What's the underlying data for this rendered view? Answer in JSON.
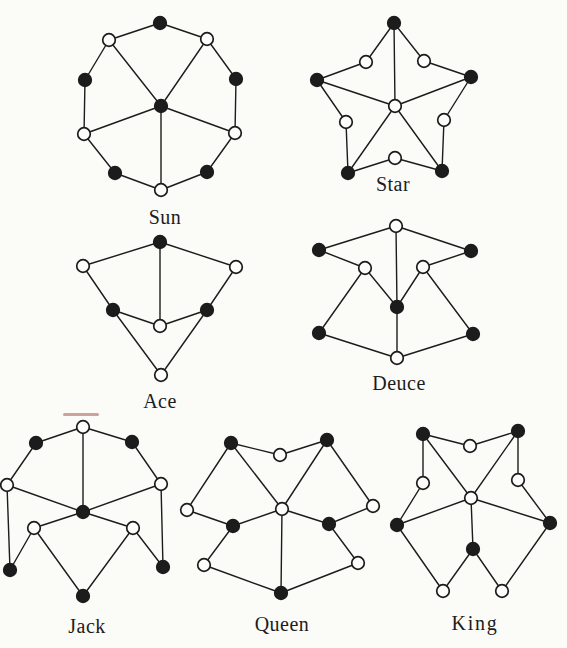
{
  "page": {
    "background": "#fbfbf8",
    "ink": "#1c1c1c",
    "open_fill": "#fdfdfc",
    "artifact": {
      "x": 63,
      "y": 413,
      "w": 36,
      "h": 3,
      "color": "rgba(145,55,45,0.45)"
    }
  },
  "style": {
    "vertex_radius": 6.3,
    "vertex_stroke_width": 1.7,
    "edge_width": 1.4,
    "label_font_size": 20,
    "default_letter_spacing": 0.5
  },
  "graphs": [
    {
      "id": "sun",
      "label": "Sun",
      "label_x": 165,
      "label_y": 224,
      "label_spacing": 0.5,
      "vertices": [
        {
          "id": "t",
          "x": 160,
          "y": 23,
          "fill": "black"
        },
        {
          "id": "tlw",
          "x": 109,
          "y": 40,
          "fill": "white"
        },
        {
          "id": "trw",
          "x": 207,
          "y": 39,
          "fill": "white"
        },
        {
          "id": "l",
          "x": 85,
          "y": 80,
          "fill": "black"
        },
        {
          "id": "r",
          "x": 236,
          "y": 79,
          "fill": "black"
        },
        {
          "id": "c",
          "x": 161,
          "y": 106,
          "fill": "black"
        },
        {
          "id": "llw",
          "x": 84,
          "y": 134,
          "fill": "white"
        },
        {
          "id": "lrw",
          "x": 235,
          "y": 133,
          "fill": "white"
        },
        {
          "id": "blb",
          "x": 115,
          "y": 173,
          "fill": "black"
        },
        {
          "id": "brb",
          "x": 207,
          "y": 172,
          "fill": "black"
        },
        {
          "id": "bw",
          "x": 161,
          "y": 190,
          "fill": "white"
        }
      ],
      "edges": [
        [
          "t",
          "trw"
        ],
        [
          "trw",
          "r"
        ],
        [
          "r",
          "lrw"
        ],
        [
          "lrw",
          "brb"
        ],
        [
          "brb",
          "bw"
        ],
        [
          "bw",
          "blb"
        ],
        [
          "blb",
          "llw"
        ],
        [
          "llw",
          "l"
        ],
        [
          "l",
          "tlw"
        ],
        [
          "tlw",
          "t"
        ],
        [
          "c",
          "tlw"
        ],
        [
          "c",
          "trw"
        ],
        [
          "c",
          "llw"
        ],
        [
          "c",
          "lrw"
        ],
        [
          "c",
          "bw"
        ]
      ]
    },
    {
      "id": "star",
      "label": "Star",
      "label_x": 393,
      "label_y": 191,
      "label_spacing": 0.5,
      "vertices": [
        {
          "id": "t",
          "x": 394,
          "y": 23,
          "fill": "black"
        },
        {
          "id": "ulw",
          "x": 366,
          "y": 62,
          "fill": "white"
        },
        {
          "id": "urw",
          "x": 424,
          "y": 61,
          "fill": "white"
        },
        {
          "id": "l",
          "x": 317,
          "y": 80,
          "fill": "black"
        },
        {
          "id": "r",
          "x": 471,
          "y": 77,
          "fill": "black"
        },
        {
          "id": "c",
          "x": 395,
          "y": 106,
          "fill": "white"
        },
        {
          "id": "llw",
          "x": 346,
          "y": 122,
          "fill": "white"
        },
        {
          "id": "lrw",
          "x": 444,
          "y": 120,
          "fill": "white"
        },
        {
          "id": "bw",
          "x": 395,
          "y": 158,
          "fill": "white"
        },
        {
          "id": "bl",
          "x": 348,
          "y": 173,
          "fill": "black"
        },
        {
          "id": "br",
          "x": 442,
          "y": 171,
          "fill": "black"
        }
      ],
      "edges": [
        [
          "t",
          "ulw"
        ],
        [
          "ulw",
          "l"
        ],
        [
          "l",
          "llw"
        ],
        [
          "llw",
          "bl"
        ],
        [
          "bl",
          "bw"
        ],
        [
          "bw",
          "br"
        ],
        [
          "br",
          "lrw"
        ],
        [
          "lrw",
          "r"
        ],
        [
          "r",
          "urw"
        ],
        [
          "urw",
          "t"
        ],
        [
          "c",
          "t"
        ],
        [
          "c",
          "l"
        ],
        [
          "c",
          "r"
        ],
        [
          "c",
          "bl"
        ],
        [
          "c",
          "br"
        ]
      ]
    },
    {
      "id": "ace",
      "label": "Ace",
      "label_x": 160,
      "label_y": 408,
      "label_spacing": 0.5,
      "vertices": [
        {
          "id": "t",
          "x": 160,
          "y": 242,
          "fill": "black"
        },
        {
          "id": "lw",
          "x": 83,
          "y": 266,
          "fill": "white"
        },
        {
          "id": "rw",
          "x": 236,
          "y": 267,
          "fill": "white"
        },
        {
          "id": "mlb",
          "x": 113,
          "y": 310,
          "fill": "black"
        },
        {
          "id": "mrb",
          "x": 207,
          "y": 310,
          "fill": "black"
        },
        {
          "id": "c",
          "x": 160,
          "y": 326,
          "fill": "white"
        },
        {
          "id": "bw",
          "x": 161,
          "y": 375,
          "fill": "white"
        }
      ],
      "edges": [
        [
          "t",
          "lw"
        ],
        [
          "t",
          "rw"
        ],
        [
          "t",
          "c"
        ],
        [
          "lw",
          "mlb"
        ],
        [
          "rw",
          "mrb"
        ],
        [
          "mlb",
          "c"
        ],
        [
          "mrb",
          "c"
        ],
        [
          "mlb",
          "bw"
        ],
        [
          "mrb",
          "bw"
        ]
      ]
    },
    {
      "id": "deuce",
      "label": "Deuce",
      "label_x": 399,
      "label_y": 390,
      "label_spacing": 0.5,
      "vertices": [
        {
          "id": "tw",
          "x": 396,
          "y": 226,
          "fill": "white"
        },
        {
          "id": "ulb",
          "x": 319,
          "y": 250,
          "fill": "black"
        },
        {
          "id": "urb",
          "x": 471,
          "y": 251,
          "fill": "black"
        },
        {
          "id": "mlw",
          "x": 365,
          "y": 268,
          "fill": "white"
        },
        {
          "id": "mrw",
          "x": 423,
          "y": 267,
          "fill": "white"
        },
        {
          "id": "c",
          "x": 397,
          "y": 307,
          "fill": "black"
        },
        {
          "id": "llb",
          "x": 319,
          "y": 333,
          "fill": "black"
        },
        {
          "id": "lrb",
          "x": 473,
          "y": 334,
          "fill": "black"
        },
        {
          "id": "bw",
          "x": 397,
          "y": 358,
          "fill": "white"
        }
      ],
      "edges": [
        [
          "tw",
          "ulb"
        ],
        [
          "tw",
          "urb"
        ],
        [
          "tw",
          "c"
        ],
        [
          "ulb",
          "mlw"
        ],
        [
          "urb",
          "mrw"
        ],
        [
          "mlw",
          "c"
        ],
        [
          "mrw",
          "c"
        ],
        [
          "mlw",
          "llb"
        ],
        [
          "mrw",
          "lrb"
        ],
        [
          "llb",
          "bw"
        ],
        [
          "lrb",
          "bw"
        ],
        [
          "c",
          "bw"
        ]
      ]
    },
    {
      "id": "jack",
      "label": "Jack",
      "label_x": 87,
      "label_y": 633,
      "label_spacing": 0.5,
      "vertices": [
        {
          "id": "tw",
          "x": 83,
          "y": 427,
          "fill": "white"
        },
        {
          "id": "ulb",
          "x": 36,
          "y": 443,
          "fill": "black"
        },
        {
          "id": "urb",
          "x": 132,
          "y": 442,
          "fill": "black"
        },
        {
          "id": "lw",
          "x": 7,
          "y": 485,
          "fill": "white"
        },
        {
          "id": "rw",
          "x": 161,
          "y": 484,
          "fill": "white"
        },
        {
          "id": "c",
          "x": 83,
          "y": 512,
          "fill": "black"
        },
        {
          "id": "llw",
          "x": 34,
          "y": 528,
          "fill": "white"
        },
        {
          "id": "lrw",
          "x": 133,
          "y": 528,
          "fill": "white"
        },
        {
          "id": "blb",
          "x": 10,
          "y": 570,
          "fill": "black"
        },
        {
          "id": "brb",
          "x": 163,
          "y": 567,
          "fill": "black"
        },
        {
          "id": "bb",
          "x": 83,
          "y": 596,
          "fill": "black"
        }
      ],
      "edges": [
        [
          "tw",
          "ulb"
        ],
        [
          "ulb",
          "lw"
        ],
        [
          "tw",
          "urb"
        ],
        [
          "urb",
          "rw"
        ],
        [
          "tw",
          "c"
        ],
        [
          "lw",
          "c"
        ],
        [
          "rw",
          "c"
        ],
        [
          "lw",
          "blb"
        ],
        [
          "rw",
          "brb"
        ],
        [
          "c",
          "llw"
        ],
        [
          "c",
          "lrw"
        ],
        [
          "llw",
          "blb"
        ],
        [
          "llw",
          "bb"
        ],
        [
          "lrw",
          "bb"
        ],
        [
          "lrw",
          "brb"
        ]
      ]
    },
    {
      "id": "queen",
      "label": "Queen",
      "label_x": 282,
      "label_y": 631,
      "label_spacing": 0.5,
      "vertices": [
        {
          "id": "tlb",
          "x": 231,
          "y": 443,
          "fill": "black"
        },
        {
          "id": "tmw",
          "x": 280,
          "y": 455,
          "fill": "white"
        },
        {
          "id": "trb",
          "x": 327,
          "y": 440,
          "fill": "black"
        },
        {
          "id": "flw",
          "x": 187,
          "y": 510,
          "fill": "white"
        },
        {
          "id": "c",
          "x": 282,
          "y": 509,
          "fill": "white"
        },
        {
          "id": "frw",
          "x": 373,
          "y": 506,
          "fill": "white"
        },
        {
          "id": "mlb",
          "x": 233,
          "y": 526,
          "fill": "black"
        },
        {
          "id": "mrb",
          "x": 329,
          "y": 524,
          "fill": "black"
        },
        {
          "id": "llw",
          "x": 204,
          "y": 565,
          "fill": "white"
        },
        {
          "id": "lrw",
          "x": 358,
          "y": 563,
          "fill": "white"
        },
        {
          "id": "bb",
          "x": 281,
          "y": 593,
          "fill": "black"
        }
      ],
      "edges": [
        [
          "tlb",
          "tmw"
        ],
        [
          "tmw",
          "trb"
        ],
        [
          "tlb",
          "flw"
        ],
        [
          "tlb",
          "c"
        ],
        [
          "trb",
          "c"
        ],
        [
          "trb",
          "frw"
        ],
        [
          "flw",
          "mlb"
        ],
        [
          "c",
          "mlb"
        ],
        [
          "c",
          "mrb"
        ],
        [
          "frw",
          "mrb"
        ],
        [
          "mlb",
          "llw"
        ],
        [
          "mrb",
          "lrw"
        ],
        [
          "llw",
          "bb"
        ],
        [
          "lrw",
          "bb"
        ],
        [
          "c",
          "bb"
        ]
      ]
    },
    {
      "id": "king",
      "label": "King",
      "label_x": 475,
      "label_y": 630,
      "label_spacing": 1.8,
      "vertices": [
        {
          "id": "tlb",
          "x": 423,
          "y": 434,
          "fill": "black"
        },
        {
          "id": "tmw",
          "x": 470,
          "y": 446,
          "fill": "white"
        },
        {
          "id": "trb",
          "x": 518,
          "y": 431,
          "fill": "black"
        },
        {
          "id": "ulw",
          "x": 423,
          "y": 483,
          "fill": "white"
        },
        {
          "id": "urw",
          "x": 518,
          "y": 480,
          "fill": "white"
        },
        {
          "id": "c",
          "x": 471,
          "y": 498,
          "fill": "white"
        },
        {
          "id": "lb",
          "x": 397,
          "y": 525,
          "fill": "black"
        },
        {
          "id": "rb",
          "x": 550,
          "y": 523,
          "fill": "black"
        },
        {
          "id": "mbb",
          "x": 473,
          "y": 549,
          "fill": "black"
        },
        {
          "id": "blw",
          "x": 443,
          "y": 591,
          "fill": "white"
        },
        {
          "id": "brw",
          "x": 502,
          "y": 591,
          "fill": "white"
        }
      ],
      "edges": [
        [
          "tlb",
          "tmw"
        ],
        [
          "tmw",
          "trb"
        ],
        [
          "tlb",
          "ulw"
        ],
        [
          "ulw",
          "lb"
        ],
        [
          "trb",
          "urw"
        ],
        [
          "urw",
          "rb"
        ],
        [
          "c",
          "tlb"
        ],
        [
          "c",
          "trb"
        ],
        [
          "c",
          "lb"
        ],
        [
          "c",
          "rb"
        ],
        [
          "c",
          "mbb"
        ],
        [
          "lb",
          "blw"
        ],
        [
          "blw",
          "mbb"
        ],
        [
          "mbb",
          "brw"
        ],
        [
          "brw",
          "rb"
        ]
      ]
    }
  ]
}
